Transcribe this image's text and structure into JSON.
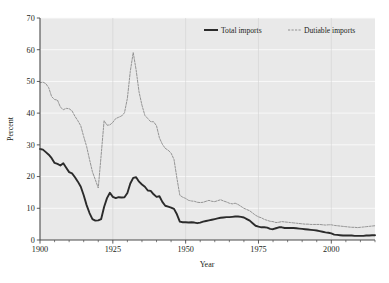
{
  "chart_data": {
    "type": "line",
    "title": "",
    "xlabel": "Year",
    "ylabel": "Percent",
    "xlim": [
      1900,
      2015
    ],
    "ylim": [
      0,
      70
    ],
    "ytick_values": [
      0,
      10,
      20,
      30,
      40,
      50,
      60,
      70
    ],
    "ytick_labels": [
      "0",
      "10",
      "20",
      "30",
      "40",
      "50",
      "60",
      "70"
    ],
    "xtick_values": [
      1900,
      1925,
      1950,
      1975,
      2000
    ],
    "xtick_labels": [
      "1900",
      "1925",
      "1950",
      "1975",
      "2000"
    ],
    "xtick_minor_step": 5,
    "grid": "horizontal-white-on-gray",
    "legend_position": "top-center",
    "plot_background": "#e9e9e9",
    "series": [
      {
        "name": "Total imports",
        "style": "solid",
        "color": "#2b2b2b",
        "x": [
          1900,
          1901,
          1902,
          1903,
          1904,
          1905,
          1906,
          1907,
          1908,
          1909,
          1910,
          1911,
          1912,
          1913,
          1914,
          1915,
          1916,
          1917,
          1918,
          1919,
          1920,
          1921,
          1922,
          1923,
          1924,
          1925,
          1926,
          1927,
          1928,
          1929,
          1930,
          1931,
          1932,
          1933,
          1934,
          1935,
          1936,
          1937,
          1938,
          1939,
          1940,
          1941,
          1942,
          1943,
          1944,
          1945,
          1946,
          1947,
          1948,
          1949,
          1950,
          1951,
          1952,
          1953,
          1954,
          1955,
          1956,
          1957,
          1958,
          1959,
          1960,
          1961,
          1962,
          1963,
          1964,
          1965,
          1966,
          1967,
          1968,
          1969,
          1970,
          1971,
          1972,
          1973,
          1974,
          1975,
          1976,
          1977,
          1978,
          1979,
          1980,
          1981,
          1982,
          1983,
          1984,
          1985,
          1986,
          1987,
          1988,
          1989,
          1990,
          1991,
          1992,
          1993,
          1994,
          1995,
          1996,
          1997,
          1998,
          1999,
          2000,
          2001,
          2002,
          2003,
          2004,
          2005,
          2006,
          2007,
          2008,
          2009,
          2010,
          2011,
          2012,
          2013,
          2014,
          2015
        ],
        "y": [
          28.7,
          28.5,
          27.7,
          26.9,
          25.8,
          24.3,
          24.0,
          23.5,
          24.2,
          22.8,
          21.4,
          21.0,
          19.8,
          18.4,
          16.8,
          14.1,
          11.0,
          8.5,
          6.6,
          6.1,
          6.2,
          6.6,
          10.4,
          13.2,
          14.9,
          13.6,
          13.2,
          13.5,
          13.4,
          13.5,
          14.8,
          17.8,
          19.6,
          19.8,
          18.4,
          17.5,
          16.8,
          15.6,
          15.5,
          14.4,
          13.6,
          13.8,
          12.0,
          10.8,
          10.5,
          10.2,
          9.8,
          8.1,
          5.8,
          5.6,
          5.6,
          5.5,
          5.6,
          5.5,
          5.3,
          5.5,
          5.8,
          6.0,
          6.2,
          6.4,
          6.6,
          6.8,
          7.0,
          7.1,
          7.2,
          7.2,
          7.3,
          7.4,
          7.4,
          7.3,
          7.1,
          6.6,
          6.1,
          5.3,
          4.5,
          4.2,
          4.0,
          4.0,
          3.9,
          3.5,
          3.4,
          3.7,
          4.0,
          4.0,
          3.8,
          3.8,
          3.8,
          3.8,
          3.7,
          3.6,
          3.5,
          3.4,
          3.3,
          3.2,
          3.1,
          3.0,
          2.8,
          2.6,
          2.4,
          2.3,
          2.1,
          1.7,
          1.6,
          1.5,
          1.4,
          1.4,
          1.4,
          1.4,
          1.3,
          1.3,
          1.3,
          1.3,
          1.4,
          1.4,
          1.5,
          1.5
        ]
      },
      {
        "name": "Dutiable imports",
        "style": "dashed",
        "color": "#8f8f8f",
        "x": [
          1900,
          1901,
          1902,
          1903,
          1904,
          1905,
          1906,
          1907,
          1908,
          1909,
          1910,
          1911,
          1912,
          1913,
          1914,
          1915,
          1916,
          1917,
          1918,
          1919,
          1920,
          1921,
          1922,
          1923,
          1924,
          1925,
          1926,
          1927,
          1928,
          1929,
          1930,
          1931,
          1932,
          1933,
          1934,
          1935,
          1936,
          1937,
          1938,
          1939,
          1940,
          1941,
          1942,
          1943,
          1944,
          1945,
          1946,
          1947,
          1948,
          1949,
          1950,
          1951,
          1952,
          1953,
          1954,
          1955,
          1956,
          1957,
          1958,
          1959,
          1960,
          1961,
          1962,
          1963,
          1964,
          1965,
          1966,
          1967,
          1968,
          1969,
          1970,
          1971,
          1972,
          1973,
          1974,
          1975,
          1976,
          1977,
          1978,
          1979,
          1980,
          1981,
          1982,
          1983,
          1984,
          1985,
          1986,
          1987,
          1988,
          1989,
          1990,
          1991,
          1992,
          1993,
          1994,
          1995,
          1996,
          1997,
          1998,
          1999,
          2000,
          2001,
          2002,
          2003,
          2004,
          2005,
          2006,
          2007,
          2008,
          2009,
          2010,
          2011,
          2012,
          2013,
          2014,
          2015
        ],
        "y": [
          49.6,
          49.8,
          49.3,
          48.0,
          45.2,
          44.3,
          44.1,
          41.9,
          41.1,
          41.5,
          41.4,
          40.7,
          39.0,
          37.6,
          36.0,
          32.6,
          29.5,
          25.4,
          21.5,
          19.0,
          16.4,
          26.8,
          37.6,
          36.2,
          36.3,
          37.1,
          38.3,
          38.7,
          39.1,
          40.1,
          44.7,
          53.2,
          59.1,
          53.6,
          46.7,
          42.5,
          39.3,
          38.3,
          37.3,
          37.3,
          36.0,
          32.2,
          30.2,
          28.9,
          28.3,
          27.4,
          25.4,
          19.5,
          14.1,
          13.5,
          13.1,
          12.5,
          12.3,
          12.2,
          11.9,
          11.8,
          11.9,
          12.2,
          12.5,
          12.2,
          12.1,
          12.4,
          12.7,
          12.3,
          12.0,
          11.6,
          11.4,
          11.6,
          11.2,
          10.6,
          10.0,
          9.6,
          9.2,
          8.5,
          7.8,
          7.3,
          7.0,
          6.5,
          6.2,
          5.9,
          5.8,
          5.5,
          5.6,
          5.8,
          5.7,
          5.6,
          5.5,
          5.4,
          5.3,
          5.2,
          5.1,
          5.0,
          5.0,
          4.9,
          4.9,
          4.9,
          4.9,
          4.8,
          4.7,
          4.8,
          4.8,
          4.6,
          4.5,
          4.4,
          4.3,
          4.2,
          4.1,
          4.0,
          4.0,
          3.9,
          4.0,
          4.1,
          4.2,
          4.3,
          4.4,
          4.5
        ]
      }
    ]
  },
  "legend": {
    "entries": [
      {
        "label": "Total imports"
      },
      {
        "label": "Dutiable imports"
      }
    ]
  },
  "axes": {
    "y_title": "Percent",
    "x_title": "Year"
  }
}
